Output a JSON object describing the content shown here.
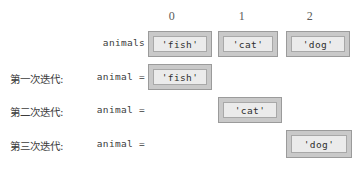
{
  "figure": {
    "background": "#ffffff",
    "box_fill": "#c9c9c9",
    "box_inner_fill": "#ebebeb",
    "box_border": "#9b9b9b",
    "text_color": "#3c3c3c"
  },
  "columns": {
    "headers": [
      "0",
      "1",
      "2"
    ]
  },
  "list_row": {
    "name": "animals",
    "values": [
      "'fish'",
      "'cat'",
      "'dog'"
    ]
  },
  "iterations": [
    {
      "step_label": "第一次迭代:",
      "var_label": "animal =",
      "value": "'fish'",
      "column": 0
    },
    {
      "step_label": "第二次迭代:",
      "var_label": "animal =",
      "value": "'cat'",
      "column": 1
    },
    {
      "step_label": "第三次迭代:",
      "var_label": "animal =",
      "value": "'dog'",
      "column": 2
    }
  ]
}
